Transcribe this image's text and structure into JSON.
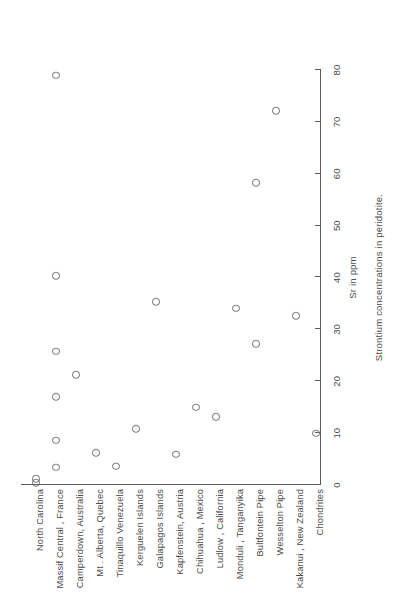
{
  "chart_data": {
    "type": "scatter",
    "title": "",
    "caption": "Strontium concentrations in peridotite.",
    "xlabel": "Sr in ppm",
    "ylabel": "",
    "xlim": [
      0,
      80
    ],
    "xticks": [
      0,
      10,
      20,
      30,
      40,
      50,
      60,
      70,
      80
    ],
    "xtick_labels": [
      "0",
      "10",
      "20",
      "30",
      "40",
      "50",
      "60",
      "70",
      "80"
    ],
    "grid": false,
    "legend": "none",
    "marker": "open-circle",
    "categories": [
      "North Carolina",
      "Massif Central , France",
      "Camperdown, Australia",
      "Mt . Alberta, Quebec",
      "Tinaquillo Venezuela",
      "Kerguelen Islands",
      "Galapagos Islands",
      "Kapfenstein, Austria",
      "Chihuahua , Mexico",
      "Ludlow , California",
      "Monduli , Tanganyika",
      "Bultfontein Pipe",
      "Wesselton Pipe",
      "Kakanui , New Zealand",
      "Chondrites"
    ],
    "points": [
      {
        "category": "North Carolina",
        "values": [
          0.4,
          1.2
        ]
      },
      {
        "category": "Massif Central , France",
        "values": [
          3.4,
          8.6,
          17.0,
          25.8,
          40.3,
          79.0
        ]
      },
      {
        "category": "Camperdown, Australia",
        "values": [
          21.2
        ]
      },
      {
        "category": "Mt . Alberta, Quebec",
        "values": [
          6.2
        ]
      },
      {
        "category": "Tinaquillo Venezuela",
        "values": [
          3.6
        ]
      },
      {
        "category": "Kerguelen Islands",
        "values": [
          10.8
        ]
      },
      {
        "category": "Galapagos Islands",
        "values": [
          35.3
        ]
      },
      {
        "category": "Kapfenstein, Austria",
        "values": [
          5.9
        ]
      },
      {
        "category": "Chihuahua , Mexico",
        "values": [
          15.0
        ]
      },
      {
        "category": "Ludlow , California",
        "values": [
          13.2
        ]
      },
      {
        "category": "Monduli , Tanganyika",
        "values": [
          34.1
        ]
      },
      {
        "category": "Bultfontein Pipe",
        "values": [
          27.2,
          58.3
        ]
      },
      {
        "category": "Wesselton Pipe",
        "values": [
          72.1
        ]
      },
      {
        "category": "Kakanui , New Zealand",
        "values": [
          32.6
        ]
      },
      {
        "category": "Chondrites",
        "values": [
          10.0
        ]
      }
    ]
  },
  "figure": {
    "orientation": "rotated-90",
    "axis_color": "#5b5b5b",
    "marker_color": "#6f6f6f",
    "text_color": "#4a4a4a",
    "background": "#ffffff"
  }
}
